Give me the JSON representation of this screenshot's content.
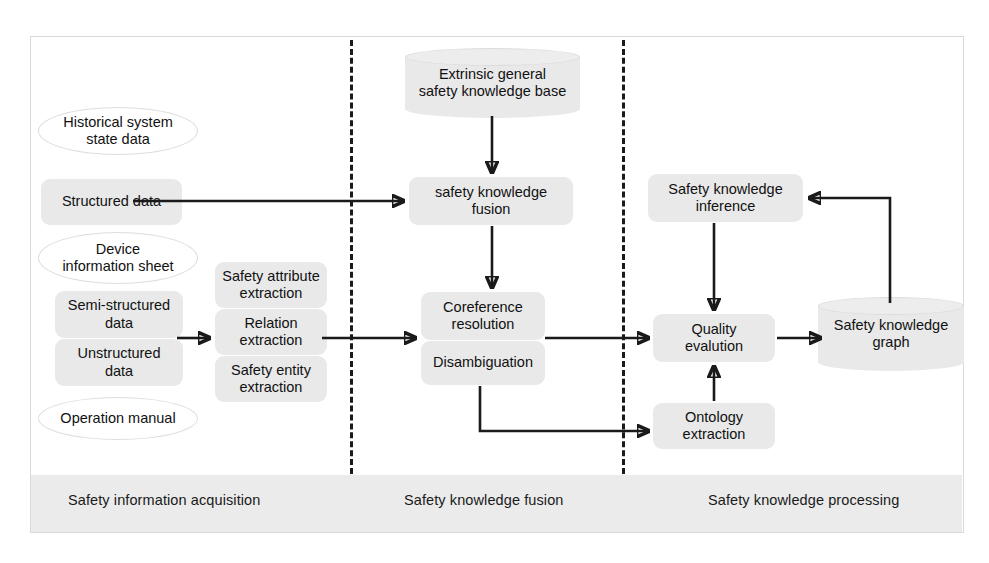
{
  "diagram": {
    "colors": {
      "node_fill": "#e9e9e9",
      "band_fill": "#ebebeb",
      "frame_border": "#d9d9d9",
      "arrow": "#1a1a1a",
      "text": "#111111"
    }
  },
  "stages": [
    {
      "id": "acquisition",
      "label": "Safety information acquisition"
    },
    {
      "id": "fusion",
      "label": "Safety knowledge fusion"
    },
    {
      "id": "processing",
      "label": "Safety knowledge processing"
    }
  ],
  "nodes": {
    "historical_system_state_data": {
      "label": "Historical system\nstate data",
      "shape": "ellipse"
    },
    "structured_data": {
      "label": "Structured data",
      "shape": "rounded-rect"
    },
    "device_information_sheet": {
      "label": "Device\ninformation sheet",
      "shape": "ellipse"
    },
    "semi_structured_data": {
      "label": "Semi-structured\ndata",
      "shape": "rounded-rect"
    },
    "unstructured_data": {
      "label": "Unstructured\ndata",
      "shape": "rounded-rect"
    },
    "operation_manual": {
      "label": "Operation manual",
      "shape": "ellipse"
    },
    "safety_attribute_extraction": {
      "label": "Safety attribute\nextraction",
      "shape": "rounded-rect"
    },
    "relation_extraction": {
      "label": "Relation\nextraction",
      "shape": "rounded-rect"
    },
    "safety_entity_extraction": {
      "label": "Safety entity\nextraction",
      "shape": "rounded-rect"
    },
    "extrinsic_general_safety_knowledge_base": {
      "label": "Extrinsic general\nsafety knowledge base",
      "shape": "cylinder"
    },
    "safety_knowledge_fusion": {
      "label": "safety knowledge\nfusion",
      "shape": "rounded-rect"
    },
    "coreference_resolution": {
      "label": "Coreference\nresolution",
      "shape": "rounded-rect"
    },
    "disambiguation": {
      "label": "Disambiguation",
      "shape": "rounded-rect"
    },
    "safety_knowledge_inference": {
      "label": "Safety knowledge\ninference",
      "shape": "rounded-rect"
    },
    "quality_evaluation": {
      "label": "Quality\nevalution",
      "shape": "rounded-rect"
    },
    "ontology_extraction": {
      "label": "Ontology\nextraction",
      "shape": "rounded-rect"
    },
    "safety_knowledge_graph": {
      "label": "Safety knowledge\ngraph",
      "shape": "cylinder"
    }
  },
  "edges": [
    {
      "from": "structured_data",
      "to": "safety_knowledge_fusion"
    },
    {
      "from": "semi_structured_data_group",
      "to": "extraction_group"
    },
    {
      "from": "extraction_group",
      "to": "coreference_resolution"
    },
    {
      "from": "extrinsic_general_safety_knowledge_base",
      "to": "safety_knowledge_fusion"
    },
    {
      "from": "safety_knowledge_fusion",
      "to": "coreference_resolution"
    },
    {
      "from": "disambiguation",
      "to": "quality_evaluation"
    },
    {
      "from": "disambiguation",
      "to": "ontology_extraction"
    },
    {
      "from": "safety_knowledge_inference",
      "to": "quality_evaluation"
    },
    {
      "from": "ontology_extraction",
      "to": "quality_evaluation"
    },
    {
      "from": "quality_evaluation",
      "to": "safety_knowledge_graph"
    },
    {
      "from": "safety_knowledge_graph",
      "to": "safety_knowledge_inference"
    }
  ]
}
